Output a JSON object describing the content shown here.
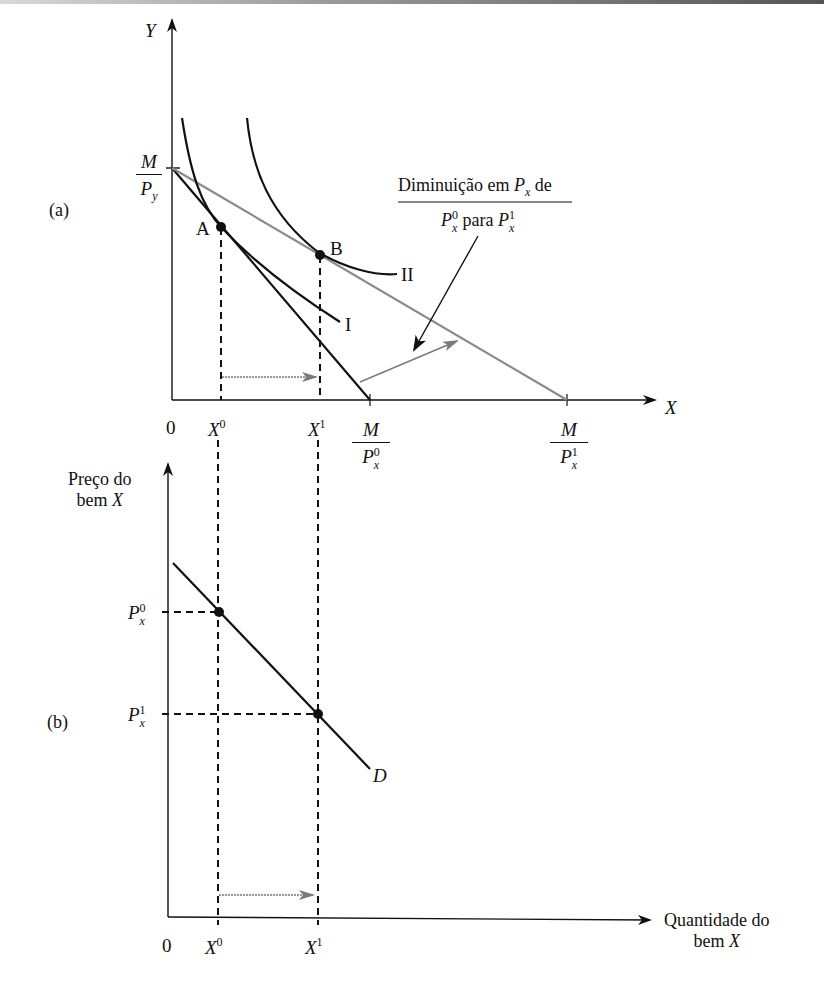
{
  "panel_a": {
    "tag": "(a)",
    "y_axis_label": "Y",
    "x_axis_label": "X",
    "origin": "0",
    "y_intercept": {
      "num": "M",
      "den": "P",
      "den_sub": "y"
    },
    "x_intercept_0": {
      "num": "M",
      "den": "P",
      "den_sub": "x",
      "den_sup": "0"
    },
    "x_intercept_1": {
      "num": "M",
      "den": "P",
      "den_sub": "x",
      "den_sup": "1"
    },
    "x_ticks": [
      {
        "label": "X",
        "sup": "0"
      },
      {
        "label": "X",
        "sup": "1"
      }
    ],
    "points": [
      {
        "label": "A"
      },
      {
        "label": "B"
      }
    ],
    "curves": [
      {
        "label": "I"
      },
      {
        "label": "II"
      }
    ],
    "annotation": {
      "line1_pre": "Diminuição em ",
      "line1_var": "P",
      "line1_sub": "x",
      "line1_post": " de",
      "line2_var_a": "P",
      "line2_sup_a": "0",
      "line2_sub_a": "x",
      "line2_mid": " para ",
      "line2_var_b": "P",
      "line2_sup_b": "1",
      "line2_sub_b": "x"
    }
  },
  "panel_b": {
    "tag": "(b)",
    "y_axis_label_line1": "Preço do",
    "y_axis_label_line2_pre": "bem ",
    "y_axis_label_line2_var": "X",
    "x_axis_label_line1": "Quantidade do",
    "x_axis_label_line2_pre": "bem ",
    "x_axis_label_line2_var": "X",
    "origin": "0",
    "y_ticks": [
      {
        "label": "P",
        "sub": "x",
        "sup": "0"
      },
      {
        "label": "P",
        "sub": "x",
        "sup": "1"
      }
    ],
    "x_ticks": [
      {
        "label": "X",
        "sup": "0"
      },
      {
        "label": "X",
        "sup": "1"
      }
    ],
    "curve_label": "D"
  },
  "colors": {
    "ink": "#111111",
    "gray_line": "#8a8a8a",
    "arrow_gray": "#7a7a7a"
  }
}
